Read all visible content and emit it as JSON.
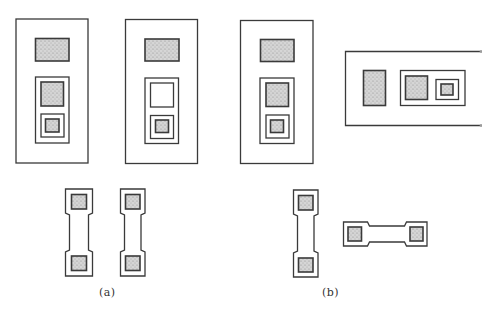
{
  "figure": {
    "colors": {
      "stroke": "#3a3a3a",
      "fill_shaded": "#c9c9c9",
      "background": "#ffffff"
    },
    "panels": [
      {
        "label": "(a)",
        "components": [
          "layout-cell-with-two-shaded-contacts",
          "layout-cell-with-one-open-contact",
          "vertical-test-pad",
          "vertical-test-pad"
        ]
      },
      {
        "label": "(b)",
        "components": [
          "layout-cell-vertical",
          "layout-cell-horizontal",
          "vertical-test-pad",
          "horizontal-test-pad"
        ]
      }
    ]
  }
}
